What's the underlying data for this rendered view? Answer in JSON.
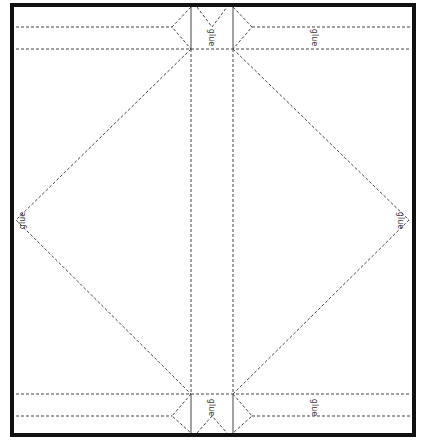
{
  "diagram": {
    "type": "papercraft-template",
    "colors": {
      "border": "#111111",
      "cut_line": "#555555",
      "fold_line": "#333333",
      "background": "#ffffff"
    },
    "labels": {
      "top_center": "glue",
      "top_right": "glue",
      "left_apex": "glue",
      "right_apex": "glue",
      "bottom_center": "glue",
      "bottom_right": "glue"
    }
  }
}
